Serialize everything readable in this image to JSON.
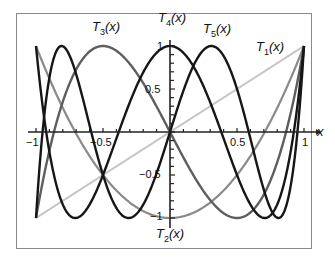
{
  "chart_data": {
    "type": "line",
    "title": "",
    "xlabel": "x",
    "ylabel": "",
    "xlim": [
      -1,
      1
    ],
    "ylim": [
      -1,
      1
    ],
    "x_ticks": [
      "-1",
      "-0.5",
      "0.5",
      "1"
    ],
    "y_ticks": [
      "1",
      "0.5",
      "-0.5",
      "-1"
    ],
    "grid": false,
    "legend": "inline curve labels",
    "series": [
      {
        "name": "T1(x)",
        "formula": "x",
        "color": "#c0c0c0",
        "x": [
          -1,
          -0.5,
          0,
          0.5,
          1
        ],
        "values": [
          -1,
          -0.5,
          0,
          0.5,
          1
        ]
      },
      {
        "name": "T2(x)",
        "formula": "2x^2-1",
        "color": "#808080",
        "x": [
          -1,
          -0.5,
          0,
          0.5,
          1
        ],
        "values": [
          1,
          -0.5,
          -1,
          -0.5,
          1
        ]
      },
      {
        "name": "T3(x)",
        "formula": "4x^3-3x",
        "color": "#606060",
        "x": [
          -1,
          -0.5,
          0,
          0.5,
          1
        ],
        "values": [
          -1,
          1,
          0,
          -1,
          1
        ]
      },
      {
        "name": "T4(x)",
        "formula": "8x^4-8x^2+1",
        "color": "#111111",
        "x": [
          -1,
          -0.5,
          0,
          0.5,
          1
        ],
        "values": [
          1,
          -0.5,
          1,
          -0.5,
          1
        ]
      },
      {
        "name": "T5(x)",
        "formula": "16x^5-20x^3+5x",
        "color": "#111111",
        "x": [
          -1,
          -0.5,
          0,
          0.5,
          1
        ],
        "values": [
          -1,
          -0.5,
          0,
          0.5,
          1
        ]
      }
    ]
  },
  "labels": {
    "t1": {
      "main": "T",
      "sub": "1",
      "arg": "(x)"
    },
    "t2": {
      "main": "T",
      "sub": "2",
      "arg": "(x)"
    },
    "t3": {
      "main": "T",
      "sub": "3",
      "arg": "(x)"
    },
    "t4": {
      "main": "T",
      "sub": "4",
      "arg": "(x)"
    },
    "t5": {
      "main": "T",
      "sub": "5",
      "arg": "(x)"
    },
    "xaxis": "x"
  },
  "ticks": {
    "xm1": "−1",
    "xm05": "−0.5",
    "x05": "0.5",
    "x1": "1",
    "y1": "1",
    "y05": "0.5",
    "ym05": "−0.5",
    "ym1": "−1"
  }
}
